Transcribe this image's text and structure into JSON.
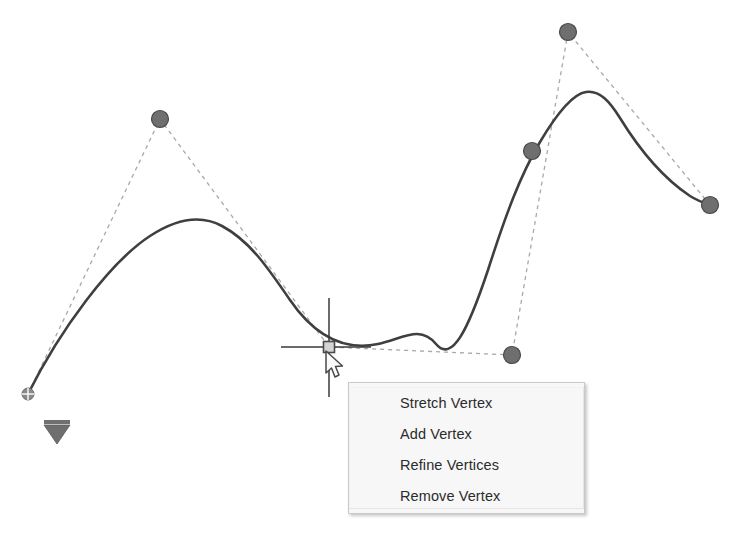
{
  "app": {
    "scene_title": "Polyline vertex editing canvas",
    "background_color": "#ffffff"
  },
  "colors": {
    "curve_stroke": "#3f3f3f",
    "guide_dash": "#a8a8a8",
    "vertex_fill": "#6f6f6f",
    "vertex_stroke": "#4a4a4a",
    "crosshair": "#3a3a3a",
    "grip_fill": "#d4d4d4",
    "grip_stroke": "#4a4a4a",
    "direction_marker": "#6e6e6e",
    "menu_background": "#f7f7f7",
    "menu_border": "#c9c9c9",
    "menu_text": "#2b2b2b"
  },
  "context_menu": {
    "name": "vertex-context-menu",
    "items": [
      {
        "label": "Stretch Vertex"
      },
      {
        "label": "Add Vertex"
      },
      {
        "label": "Refine Vertices"
      },
      {
        "label": "Remove Vertex"
      }
    ]
  },
  "canvas": {
    "spline_path": "M 28 394 C 60 330 110 262 150 236 C 176 219 200 214 222 226 C 250 241 268 268 290 300 C 312 332 340 352 378 344 C 404 338 420 325 436 344 C 452 363 468 330 488 270 C 506 214 520 176 540 142 C 556 115 572 94 586 92 C 600 90 610 102 620 118 C 636 144 660 176 690 196 C 698 201 704 203 710 205",
    "guide_polyline": [
      {
        "x": 28,
        "y": 394,
        "label": "start-point"
      },
      {
        "x": 160,
        "y": 119,
        "label": "vertex-1"
      },
      {
        "x": 329,
        "y": 347,
        "label": "selected-vertex"
      },
      {
        "x": 512,
        "y": 355,
        "label": "vertex-3"
      },
      {
        "x": 568,
        "y": 32,
        "label": "vertex-4"
      },
      {
        "x": 710,
        "y": 205,
        "label": "end-point"
      }
    ],
    "vertex_markers": [
      {
        "x": 160,
        "y": 119,
        "r": 8.5,
        "name": "vertex-marker-1"
      },
      {
        "x": 568,
        "y": 32,
        "r": 8.5,
        "name": "vertex-marker-2"
      },
      {
        "x": 532,
        "y": 151,
        "r": 8.5,
        "name": "vertex-marker-3"
      },
      {
        "x": 512,
        "y": 355,
        "r": 8.5,
        "name": "vertex-marker-4"
      },
      {
        "x": 710,
        "y": 205,
        "r": 8.5,
        "name": "vertex-marker-5"
      }
    ],
    "selected_vertex_grip": {
      "x": 329,
      "y": 347,
      "size": 11
    },
    "crosshair": {
      "center_x": 329,
      "center_y": 347,
      "h_left": 281,
      "h_right": 371,
      "v_top": 298,
      "v_bottom": 397
    },
    "start_marker": {
      "x": 28,
      "y": 394,
      "r": 6,
      "name": "start-cross-marker"
    },
    "direction_marker": {
      "x": 57,
      "y": 421,
      "width": 26,
      "height": 23
    }
  }
}
